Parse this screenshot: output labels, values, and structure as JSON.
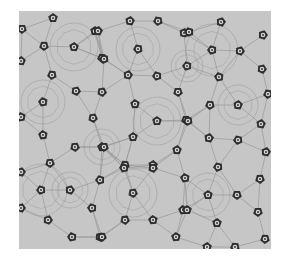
{
  "image": {
    "kind": "quasicrystal-like micrograph pattern",
    "bounds": {
      "x": 19,
      "y": 11,
      "width": 252,
      "height": 238
    },
    "colors": {
      "page_background": "#ffffff",
      "tile_background": "#c6c6c6",
      "line": "#8f8f8f",
      "pentagon_fill": "#2e2e2e",
      "pentagon_ring": "#d4d4d4",
      "pentagon_core": "#3a3a3a"
    },
    "pentagon_size": 10,
    "pentagon_centers_source": "measured from zoomed crops of the screenshot",
    "pentagons": [
      [
        53,
        18
      ],
      [
        22,
        29
      ],
      [
        95,
        31
      ],
      [
        44,
        46
      ],
      [
        74,
        47
      ],
      [
        102,
        58
      ],
      [
        21,
        61
      ],
      [
        52,
        75
      ],
      [
        130,
        21
      ],
      [
        158,
        21
      ],
      [
        98,
        31
      ],
      [
        138,
        49
      ],
      [
        184,
        33
      ],
      [
        104,
        59
      ],
      [
        128,
        75
      ],
      [
        157,
        76
      ],
      [
        221,
        22
      ],
      [
        189,
        32
      ],
      [
        263,
        35
      ],
      [
        212,
        50
      ],
      [
        240,
        51
      ],
      [
        187,
        66
      ],
      [
        262,
        69
      ],
      [
        219,
        77
      ],
      [
        76,
        91
      ],
      [
        43,
        102
      ],
      [
        102,
        92
      ],
      [
        21,
        117
      ],
      [
        93,
        118
      ],
      [
        43,
        135
      ],
      [
        75,
        147
      ],
      [
        102,
        147
      ],
      [
        50,
        163
      ],
      [
        135,
        104
      ],
      [
        178,
        92
      ],
      [
        157,
        121
      ],
      [
        186,
        120
      ],
      [
        133,
        137
      ],
      [
        104,
        147
      ],
      [
        177,
        150
      ],
      [
        125,
        165
      ],
      [
        153,
        165
      ],
      [
        210,
        105
      ],
      [
        238,
        105
      ],
      [
        268,
        94
      ],
      [
        261,
        124
      ],
      [
        188,
        121
      ],
      [
        209,
        138
      ],
      [
        238,
        140
      ],
      [
        266,
        152
      ],
      [
        218,
        167
      ],
      [
        21,
        172
      ],
      [
        41,
        190
      ],
      [
        70,
        190
      ],
      [
        100,
        180
      ],
      [
        21,
        208
      ],
      [
        92,
        208
      ],
      [
        48,
        220
      ],
      [
        72,
        237
      ],
      [
        100,
        237
      ],
      [
        124,
        168
      ],
      [
        153,
        168
      ],
      [
        185,
        178
      ],
      [
        133,
        193
      ],
      [
        183,
        210
      ],
      [
        125,
        220
      ],
      [
        153,
        220
      ],
      [
        102,
        237
      ],
      [
        176,
        237
      ],
      [
        260,
        179
      ],
      [
        208,
        195
      ],
      [
        237,
        195
      ],
      [
        187,
        210
      ],
      [
        258,
        212
      ],
      [
        217,
        223
      ],
      [
        265,
        239
      ],
      [
        207,
        247
      ],
      [
        235,
        247
      ]
    ],
    "line_network_source": "procedurally approximated, not traced from the image",
    "rings": [
      [
        74,
        47,
        24
      ],
      [
        138,
        49,
        22
      ],
      [
        212,
        50,
        26
      ],
      [
        43,
        102,
        22
      ],
      [
        157,
        121,
        24
      ],
      [
        238,
        105,
        20
      ],
      [
        41,
        190,
        26
      ],
      [
        133,
        193,
        24
      ],
      [
        208,
        195,
        22
      ],
      [
        102,
        147,
        18
      ],
      [
        187,
        66,
        16
      ],
      [
        70,
        190,
        18
      ]
    ]
  }
}
